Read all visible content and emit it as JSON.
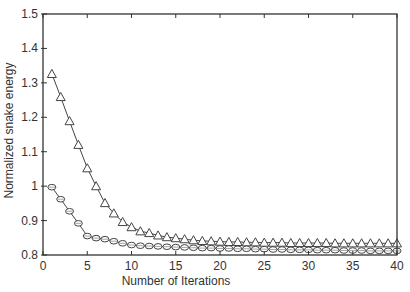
{
  "chart_data": {
    "type": "line",
    "title": "",
    "xlabel": "Number of Iterations",
    "ylabel": "Normalized snake energy",
    "xlim": [
      0,
      40
    ],
    "ylim": [
      0.8,
      1.5
    ],
    "xticks": [
      0,
      5,
      10,
      15,
      20,
      25,
      30,
      35,
      40
    ],
    "xtick_labels": [
      "0",
      "5",
      "10",
      "15",
      "20",
      "25",
      "30",
      "35",
      "40"
    ],
    "yticks": [
      0.8,
      0.9,
      1.0,
      1.1,
      1.2,
      1.3,
      1.4,
      1.5
    ],
    "ytick_labels": [
      "0.8",
      "0.9",
      "1",
      "1.1",
      "1.2",
      "1.3",
      "1.4",
      "1.5"
    ],
    "grid": false,
    "legend": null,
    "x": [
      1,
      2,
      3,
      4,
      5,
      6,
      7,
      8,
      9,
      10,
      11,
      12,
      13,
      14,
      15,
      16,
      17,
      18,
      19,
      20,
      21,
      22,
      23,
      24,
      25,
      26,
      27,
      28,
      29,
      30,
      31,
      32,
      33,
      34,
      35,
      36,
      37,
      38,
      39,
      40
    ],
    "series": [
      {
        "name": "triangle-series",
        "marker": "triangle",
        "values": [
          1.326,
          1.259,
          1.189,
          1.12,
          1.052,
          1.0,
          0.951,
          0.921,
          0.896,
          0.881,
          0.869,
          0.864,
          0.857,
          0.852,
          0.849,
          0.846,
          0.843,
          0.841,
          0.84,
          0.839,
          0.838,
          0.838,
          0.837,
          0.837,
          0.836,
          0.836,
          0.836,
          0.835,
          0.835,
          0.835,
          0.835,
          0.835,
          0.834,
          0.834,
          0.834,
          0.834,
          0.834,
          0.834,
          0.834,
          0.834
        ]
      },
      {
        "name": "circle-series",
        "marker": "circle",
        "values": [
          0.997,
          0.962,
          0.927,
          0.892,
          0.855,
          0.849,
          0.846,
          0.84,
          0.834,
          0.829,
          0.827,
          0.826,
          0.825,
          0.824,
          0.823,
          0.822,
          0.821,
          0.82,
          0.82,
          0.819,
          0.819,
          0.818,
          0.818,
          0.817,
          0.817,
          0.816,
          0.816,
          0.815,
          0.815,
          0.815,
          0.814,
          0.814,
          0.814,
          0.813,
          0.813,
          0.813,
          0.812,
          0.812,
          0.812,
          0.812
        ]
      }
    ]
  }
}
